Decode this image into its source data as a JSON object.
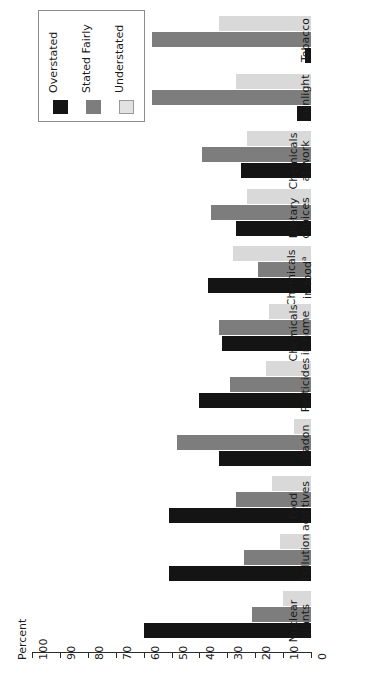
{
  "chart_data": {
    "type": "bar",
    "orientation": "horizontal",
    "title": "",
    "xlabel": "",
    "ylabel": "Percent",
    "axis_title": "Percent",
    "ylim": [
      0,
      100
    ],
    "tick_values": [
      100,
      90,
      80,
      70,
      60,
      50,
      40,
      30,
      20,
      10,
      0
    ],
    "tick_labels": [
      "100",
      "90",
      "80",
      "70",
      "60",
      "50",
      "40",
      "30",
      "20",
      "10",
      "0"
    ],
    "grid": false,
    "legend_position": "top-left",
    "value_axis_direction": "right-to-left",
    "categories": [
      "Tobacco",
      "Sunlight",
      "Chemicals at work",
      "Dietary choices",
      "Chemicals in food",
      "Chemicals in home",
      "Pesticides",
      "Radon",
      "Food additives",
      "Pollution",
      "Nuclear plants"
    ],
    "category_lines": [
      [
        "Tobacco",
        ""
      ],
      [
        "Sunlight",
        ""
      ],
      [
        "Chemicals",
        "at work"
      ],
      [
        "Dietary",
        "choices"
      ],
      [
        "Chemicals",
        "in food"
      ],
      [
        "Chemicals",
        "in home"
      ],
      [
        "Pesticides",
        ""
      ],
      [
        "Radon",
        ""
      ],
      [
        "Food",
        "additives"
      ],
      [
        "Pollution",
        ""
      ],
      [
        "Nuclear",
        "plants"
      ]
    ],
    "category_footnote_marks": {
      "Chemicals in food": "a"
    },
    "series": [
      {
        "name": "Overstated",
        "color": "#141414",
        "values": [
          2,
          5,
          25,
          27,
          37,
          32,
          40,
          33,
          51,
          51,
          60
        ]
      },
      {
        "name": "Stated Fairly",
        "color": "#7d7d7d",
        "values": [
          57,
          57,
          39,
          36,
          19,
          33,
          29,
          48,
          27,
          24,
          21
        ]
      },
      {
        "name": "Understated",
        "color": "#d9d9d9",
        "values": [
          33,
          27,
          23,
          23,
          28,
          15,
          16,
          6,
          14,
          11,
          10
        ]
      }
    ]
  },
  "legend": {
    "title": "",
    "items": [
      {
        "label": "Overstated",
        "color": "#141414"
      },
      {
        "label": "Stated Fairly",
        "color": "#7d7d7d"
      },
      {
        "label": "Understated",
        "color": "#e2e2e2"
      }
    ]
  },
  "axis": {
    "title": "Percent"
  }
}
